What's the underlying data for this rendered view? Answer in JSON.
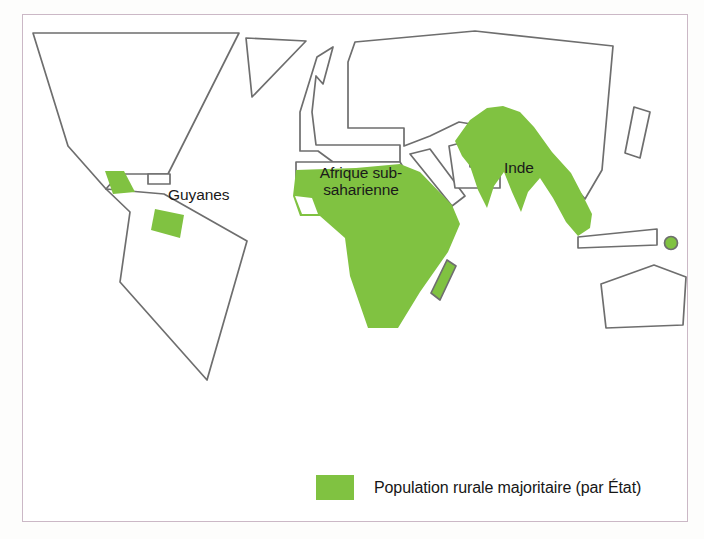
{
  "figure": {
    "type": "thematic-world-map",
    "frame_color": "#cbb8c6",
    "background_color": "#ffffff"
  },
  "map": {
    "outline_color": "#6e6e6e",
    "highlight_color": "#80c241",
    "labels": [
      {
        "id": "guyanes",
        "text": "Guyanes"
      },
      {
        "id": "afrique",
        "text": "Afrique sub-saharienne"
      },
      {
        "id": "inde",
        "text": "Inde"
      }
    ],
    "highlighted_regions": [
      "Guyanes",
      "Afrique sub-saharienne",
      "Inde",
      "Madagascar",
      "Sri Lanka"
    ]
  },
  "legend": {
    "swatch_color": "#80c241",
    "label": "Population rurale majoritaire (par État)"
  }
}
